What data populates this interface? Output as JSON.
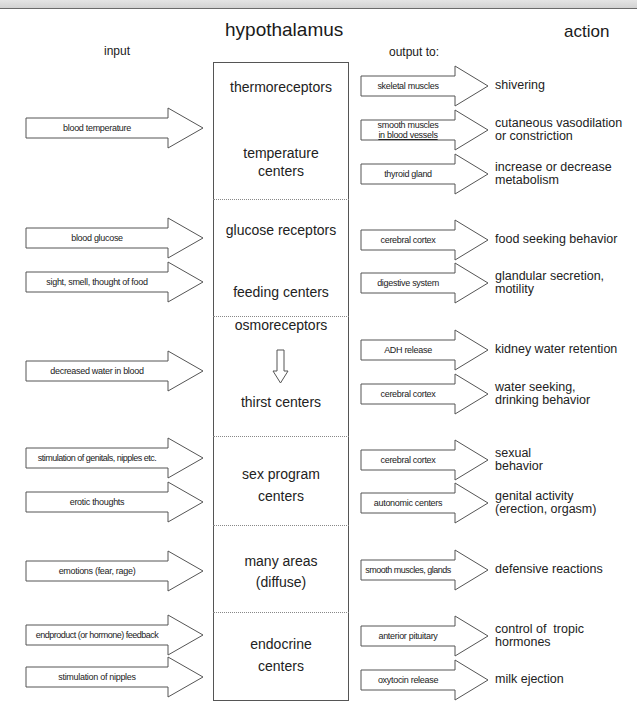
{
  "header": {
    "title": "hypothalamus",
    "input_label": "input",
    "output_label": "output to:",
    "action_label": "action"
  },
  "hypothalamus_sections": [
    {
      "name": "thermoreceptors",
      "line1": "thermoreceptors",
      "line2": ""
    },
    {
      "name": "temperature-centers",
      "line1": "temperature",
      "line2": "centers"
    },
    {
      "name": "glucose-receptors",
      "line1": "glucose receptors",
      "line2": ""
    },
    {
      "name": "feeding-centers",
      "line1": "feeding centers",
      "line2": ""
    },
    {
      "name": "osmoreceptors",
      "line1": "osmoreceptors",
      "line2": ""
    },
    {
      "name": "thirst-centers",
      "line1": "thirst centers",
      "line2": ""
    },
    {
      "name": "sex-program-centers",
      "line1": "sex program",
      "line2": "centers"
    },
    {
      "name": "many-areas",
      "line1": "many areas",
      "line2": "(diffuse)"
    },
    {
      "name": "endocrine-centers",
      "line1": "endocrine",
      "line2": "centers"
    }
  ],
  "inputs": [
    {
      "label": "blood temperature",
      "y": 128
    },
    {
      "label": "blood glucose",
      "y": 238
    },
    {
      "label": "sight, smell, thought of food",
      "y": 282
    },
    {
      "label": "decreased water in blood",
      "y": 371
    },
    {
      "label": "stimulation of genitals, nipples etc.",
      "y": 458
    },
    {
      "label": "erotic thoughts",
      "y": 502
    },
    {
      "label": "emotions (fear, rage)",
      "y": 571
    },
    {
      "label": "endproduct (or hormone) feedback",
      "y": 635
    },
    {
      "label": "stimulation of nipples",
      "y": 677
    }
  ],
  "outputs": [
    {
      "target": "skeletal muscles",
      "target2": "",
      "action": "shivering",
      "action2": "",
      "y": 86
    },
    {
      "target": "smooth muscles",
      "target2": "in blood vessels",
      "action": "cutaneous vasodilation",
      "action2": "or constriction",
      "y": 130
    },
    {
      "target": "thyroid gland",
      "target2": "",
      "action": "increase or decrease",
      "action2": "metabolism",
      "y": 174
    },
    {
      "target": "cerebral cortex",
      "target2": "",
      "action": "food seeking behavior",
      "action2": "",
      "y": 240
    },
    {
      "target": "digestive system",
      "target2": "",
      "action": "glandular secretion,",
      "action2": "motility",
      "y": 283
    },
    {
      "target": "ADH release",
      "target2": "",
      "action": "kidney water retention",
      "action2": "",
      "y": 350
    },
    {
      "target": "cerebral cortex",
      "target2": "",
      "action": "water seeking,",
      "action2": "drinking behavior",
      "y": 394
    },
    {
      "target": "cerebral cortex",
      "target2": "",
      "action": "sexual",
      "action2": "behavior",
      "y": 460
    },
    {
      "target": "autonomic centers",
      "target2": "",
      "action": "genital activity",
      "action2": "(erection, orgasm)",
      "y": 503
    },
    {
      "target": "smooth muscles, glands",
      "target2": "",
      "action": "defensive reactions",
      "action2": "",
      "y": 570
    },
    {
      "target": "anterior pituitary",
      "target2": "",
      "action": "control of  tropic",
      "action2": "hormones",
      "y": 636
    },
    {
      "target": "oxytocin release",
      "target2": "",
      "action": "milk ejection",
      "action2": "",
      "y": 680
    }
  ],
  "colors": {
    "line": "#555555",
    "text": "#1a1a1a",
    "background": "#ffffff"
  }
}
